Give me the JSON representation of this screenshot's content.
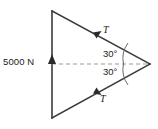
{
  "diagram": {
    "type": "free-body-force-diagram",
    "background_color": "#ffffff",
    "stroke_color": "#3a3a3a",
    "dash_color": "#9a9a9a",
    "text_color": "#1a1a1a",
    "labels": {
      "applied_force": "5000 N",
      "tension_top": "T",
      "tension_bottom": "T",
      "angle_top": "30°",
      "angle_bottom": "30°"
    },
    "geometry": {
      "vertex_top_left": [
        52,
        11
      ],
      "vertex_bottom_left": [
        52,
        118
      ],
      "vertex_right": [
        150,
        64
      ],
      "dashed_axis_from": [
        52,
        64
      ],
      "dashed_axis_to": [
        150,
        64
      ]
    },
    "arrows": [
      {
        "name": "applied-force-arrow",
        "label": "5000 N",
        "at": [
          52,
          61
        ],
        "direction": "up"
      },
      {
        "name": "tension-top-arrow",
        "label": "T",
        "at": [
          97,
          34
        ],
        "direction": "up-right"
      },
      {
        "name": "tension-bottom-arrow",
        "label": "T",
        "at": [
          97,
          92
        ],
        "direction": "down-right"
      }
    ]
  }
}
